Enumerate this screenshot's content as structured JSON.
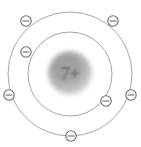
{
  "diagram": {
    "element_symbol_text": "7+",
    "nucleus": {
      "label": "7+",
      "charge": 7,
      "center_x": 70,
      "center_y": 73,
      "radius": 22,
      "fill_center_color": "#9a9a9a",
      "fill_edge_color": "#d8d8d8",
      "text_color": "#5a5a5a"
    },
    "canvas": {
      "width": 141,
      "height": 147,
      "background_color": "#ffffff",
      "center_x": 70,
      "center_y": 74
    },
    "shells": [
      {
        "name": "inner-shell",
        "index": 1,
        "radius": 42,
        "electron_count": 2,
        "stroke_color": "#9b9b9b"
      },
      {
        "name": "outer-shell",
        "index": 2,
        "radius": 62,
        "electron_count": 5,
        "stroke_color": "#9b9b9b"
      }
    ],
    "electrons": [
      {
        "id": "electron-1",
        "shell": "outer-shell",
        "cx": 26,
        "cy": 21,
        "r": 5.2,
        "symbol": "minus"
      },
      {
        "id": "electron-2",
        "shell": "inner-shell",
        "cx": 26,
        "cy": 52,
        "r": 5.2,
        "symbol": "minus"
      },
      {
        "id": "electron-3",
        "shell": "outer-shell",
        "cx": 9,
        "cy": 95,
        "r": 5.2,
        "symbol": "minus"
      },
      {
        "id": "electron-4",
        "shell": "outer-shell",
        "cx": 71,
        "cy": 136,
        "r": 5.2,
        "symbol": "minus"
      },
      {
        "id": "electron-5",
        "shell": "outer-shell",
        "cx": 131,
        "cy": 95,
        "r": 5.2,
        "symbol": "minus"
      },
      {
        "id": "electron-6",
        "shell": "outer-shell",
        "cx": 113,
        "cy": 21,
        "r": 5.2,
        "symbol": "minus"
      },
      {
        "id": "electron-7",
        "shell": "inner-shell",
        "cx": 106,
        "cy": 101,
        "r": 5.2,
        "symbol": "minus"
      }
    ],
    "total_electrons": 7,
    "electron_symbol_char": "−",
    "electron_stroke_color": "#6a6a6a",
    "electron_fill_color": "#ffffff"
  }
}
